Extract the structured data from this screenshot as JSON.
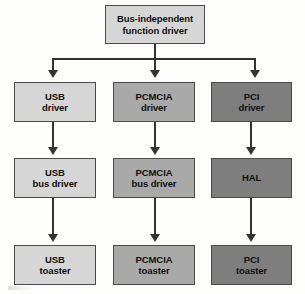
{
  "diagram": {
    "background_color": "#fdfdfc",
    "border_color": "#4a4a4a",
    "connector_color": "#333333",
    "fills": {
      "light": "#d6d6d6",
      "medium": "#a9a9a9",
      "dark": "#7e7e7e"
    },
    "root": {
      "label": "Bus-independent\nfunction driver",
      "fill": "light"
    },
    "columns": [
      {
        "name": "usb",
        "fill": "light",
        "driver": "USB\ndriver",
        "bus_driver": "USB\nbus driver",
        "device": "USB\ntoaster"
      },
      {
        "name": "pcmcia",
        "fill": "medium",
        "driver": "PCMCIA\ndriver",
        "bus_driver": "PCMCIA\nbus driver",
        "device": "PCMCIA\ntoaster"
      },
      {
        "name": "pci",
        "fill": "dark",
        "driver": "PCI\ndriver",
        "bus_driver": "HAL",
        "device": "PCI\ntoaster"
      }
    ]
  }
}
